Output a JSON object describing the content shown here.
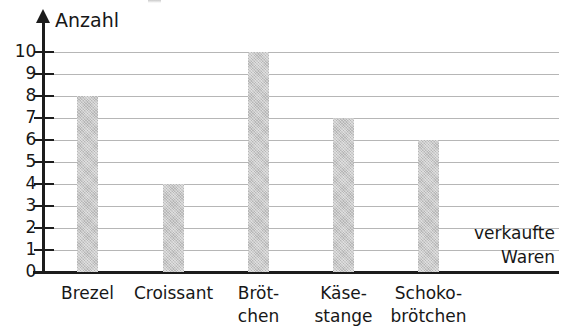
{
  "chart_data": {
    "type": "bar",
    "title": "",
    "subtitle": "",
    "xlabel": "verkaufte Waren",
    "xlabel_lines": [
      "verkaufte",
      "Waren"
    ],
    "ylabel": "Anzahl",
    "categories": [
      "Brezel",
      "Croissant",
      "Brötchen",
      "Käsestange",
      "Schokobrötchen"
    ],
    "category_label_lines": [
      [
        "Brezel"
      ],
      [
        "Croissant"
      ],
      [
        "Bröt-",
        "chen"
      ],
      [
        "Käse-",
        "stange"
      ],
      [
        "Schoko-",
        "brötchen"
      ]
    ],
    "values": [
      8,
      4,
      10,
      7,
      6
    ],
    "ylim": [
      0,
      10
    ],
    "ytick_labels": [
      "10",
      "9",
      "8",
      "7",
      "6",
      "5",
      "4",
      "3",
      "2",
      "1",
      "0"
    ],
    "ytick_values": [
      10,
      9,
      8,
      7,
      6,
      5,
      4,
      3,
      2,
      1,
      0
    ],
    "grid": "horizontal",
    "legend": "none",
    "bar_color": "#c3c3c3",
    "axis_color": "#1c1c1c",
    "grid_color": "#b6b6b6",
    "text_color": "#171717"
  },
  "elements": {
    "y_axis_arrow_name": "y-axis-arrow-icon",
    "chart_title_text": ""
  }
}
